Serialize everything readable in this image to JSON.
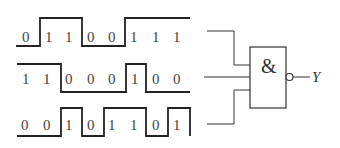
{
  "diagram": {
    "type": "logic-gate-timing",
    "gate": {
      "symbol": "&",
      "kind": "NAND",
      "output_label": "Y"
    },
    "inputs": [
      {
        "name": "input-a",
        "bits": [
          "0",
          "1",
          "1",
          "0",
          "0",
          "1",
          "1",
          "1"
        ]
      },
      {
        "name": "input-b",
        "bits": [
          "1",
          "1",
          "0",
          "0",
          "0",
          "1",
          "0",
          "0"
        ]
      },
      {
        "name": "input-c",
        "bits": [
          "0",
          "0",
          "1",
          "0",
          "1",
          "1",
          "0",
          "1"
        ]
      }
    ]
  }
}
